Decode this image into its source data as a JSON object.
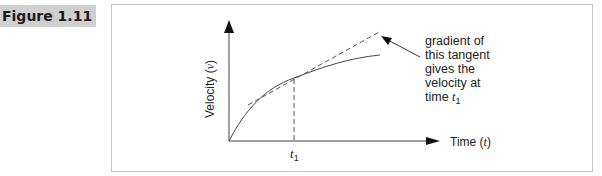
{
  "figure": {
    "label": "Figure 1.11"
  },
  "diagram": {
    "y_axis_label": "Velocity (",
    "y_axis_var": "v",
    "y_axis_close": ")",
    "x_axis_label": "Time (",
    "x_axis_var": "t",
    "x_axis_close": ")",
    "t1_label": "t",
    "t1_sub": "1",
    "annotation_lines": [
      "gradient of",
      "this tangent",
      "gives the",
      "velocity at"
    ],
    "annotation_last": "time ",
    "annotation_var": "t",
    "annotation_sub": "1"
  }
}
